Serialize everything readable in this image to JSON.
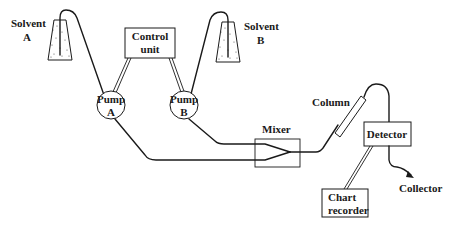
{
  "diagram": {
    "components": {
      "solvent_a": {
        "line1": "Solvent",
        "line2": "A"
      },
      "solvent_b": {
        "line1": "Solvent",
        "line2": "B"
      },
      "control_unit": {
        "line1": "Control",
        "line2": "unit"
      },
      "pump_a": {
        "line1": "Pump",
        "line2": "A"
      },
      "pump_b": {
        "line1": "Pump",
        "line2": "B"
      },
      "mixer": {
        "label": "Mixer"
      },
      "column": {
        "label": "Column"
      },
      "detector": {
        "label": "Detector"
      },
      "chart_recorder": {
        "line1": "Chart",
        "line2": "recorder"
      },
      "collector": {
        "label": "Collector"
      }
    },
    "connections": [
      {
        "from": "Solvent A",
        "to": "Pump A",
        "type": "tube"
      },
      {
        "from": "Solvent B",
        "to": "Pump B",
        "type": "tube"
      },
      {
        "from": "Control unit",
        "to": "Pump A",
        "type": "signal"
      },
      {
        "from": "Control unit",
        "to": "Pump B",
        "type": "signal"
      },
      {
        "from": "Pump A",
        "to": "Mixer",
        "type": "tube"
      },
      {
        "from": "Pump B",
        "to": "Mixer",
        "type": "tube"
      },
      {
        "from": "Mixer",
        "to": "Column",
        "type": "tube"
      },
      {
        "from": "Column",
        "to": "Detector",
        "type": "tube"
      },
      {
        "from": "Detector",
        "to": "Chart recorder",
        "type": "signal"
      },
      {
        "from": "Detector",
        "to": "Collector",
        "type": "tube"
      }
    ],
    "colors": {
      "line": "#1a1a1a",
      "background": "#ffffff"
    }
  }
}
